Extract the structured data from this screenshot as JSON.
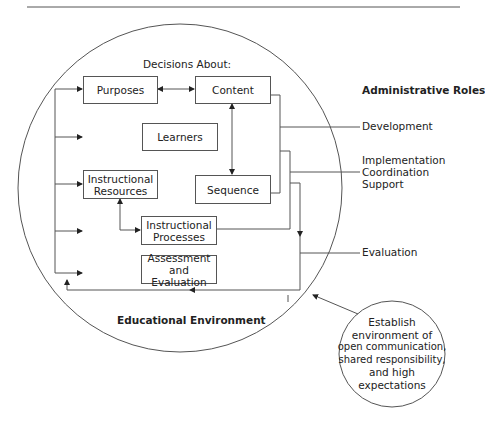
{
  "diagram": {
    "heading": "Decisions About:",
    "boxes": {
      "purposes": "Purposes",
      "content": "Content",
      "learners": "Learners",
      "resources_1": "Instructional",
      "resources_2": "Resources",
      "sequence": "Sequence",
      "processes_1": "Instructional",
      "processes_2": "Processes",
      "assessment_1": "Assessment",
      "assessment_2": "and Evaluation"
    },
    "environment_label": "Educational Environment",
    "admin_roles": {
      "title": "Administrative Roles",
      "development": "Development",
      "implementation": "Implementation",
      "coordination": "Coordination",
      "support": "Support",
      "evaluation": "Evaluation"
    },
    "small_circle": {
      "lines": [
        "Establish",
        "environment of",
        "open communication,",
        "shared responsibility,",
        "and high",
        "expectations"
      ]
    },
    "colors": {
      "line": "#555555",
      "text": "#222222"
    }
  }
}
